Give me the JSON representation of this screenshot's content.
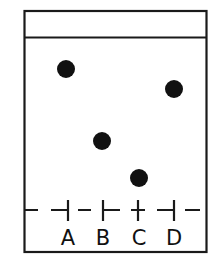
{
  "diagram": {
    "type": "thin-layer chromatography plate",
    "frame": {
      "x": 24,
      "y": 10,
      "width": 183,
      "height": 242,
      "stroke": "#1a1a1a"
    },
    "solvent_front_y": 37,
    "baseline_y": 210,
    "lanes": [
      {
        "label": "A",
        "x": 68,
        "spot": {
          "x": 66,
          "y": 69
        }
      },
      {
        "label": "B",
        "x": 103,
        "spot": {
          "x": 102,
          "y": 141
        }
      },
      {
        "label": "C",
        "x": 138,
        "spot": {
          "x": 139,
          "y": 178
        }
      },
      {
        "label": "D",
        "x": 174,
        "spot": {
          "x": 174,
          "y": 89
        }
      }
    ],
    "spot_radius": 9,
    "colors": {
      "ink": "#1a1a1a",
      "background": "#ffffff"
    }
  }
}
